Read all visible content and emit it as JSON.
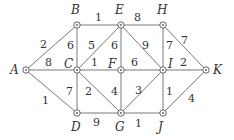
{
  "graph": {
    "nodes": [
      {
        "id": "A",
        "x": 26,
        "y": 70,
        "lx": 10,
        "ly": 74
      },
      {
        "id": "B",
        "x": 77,
        "y": 25,
        "lx": 71,
        "ly": 14
      },
      {
        "id": "E",
        "x": 121,
        "y": 25,
        "lx": 115,
        "ly": 14
      },
      {
        "id": "H",
        "x": 163,
        "y": 25,
        "lx": 157,
        "ly": 14
      },
      {
        "id": "C",
        "x": 77,
        "y": 70,
        "lx": 64,
        "ly": 68
      },
      {
        "id": "F",
        "x": 121,
        "y": 70,
        "lx": 108,
        "ly": 68
      },
      {
        "id": "I",
        "x": 163,
        "y": 70,
        "lx": 168,
        "ly": 68
      },
      {
        "id": "K",
        "x": 206,
        "y": 70,
        "lx": 213,
        "ly": 74
      },
      {
        "id": "D",
        "x": 77,
        "y": 113,
        "lx": 71,
        "ly": 131
      },
      {
        "id": "G",
        "x": 121,
        "y": 113,
        "lx": 115,
        "ly": 131
      },
      {
        "id": "J",
        "x": 163,
        "y": 113,
        "lx": 158,
        "ly": 131
      }
    ],
    "edges": [
      {
        "from": "A",
        "to": "B",
        "w": "2",
        "lx": 40,
        "ly": 48
      },
      {
        "from": "A",
        "to": "C",
        "w": "8",
        "lx": 45,
        "ly": 66
      },
      {
        "from": "A",
        "to": "D",
        "w": "1",
        "lx": 42,
        "ly": 104
      },
      {
        "from": "B",
        "to": "C",
        "w": "6",
        "lx": 67,
        "ly": 49
      },
      {
        "from": "B",
        "to": "E",
        "w": "1",
        "lx": 95,
        "ly": 21
      },
      {
        "from": "C",
        "to": "E",
        "w": "5",
        "lx": 88,
        "ly": 49
      },
      {
        "from": "E",
        "to": "F",
        "w": "6",
        "lx": 111,
        "ly": 49
      },
      {
        "from": "C",
        "to": "F",
        "w": "1",
        "lx": 91,
        "ly": 66
      },
      {
        "from": "E",
        "to": "H",
        "w": "8",
        "lx": 134,
        "ly": 21
      },
      {
        "from": "E",
        "to": "I",
        "w": "9",
        "lx": 142,
        "ly": 49
      },
      {
        "from": "F",
        "to": "I",
        "w": "6",
        "lx": 131,
        "ly": 66
      },
      {
        "from": "H",
        "to": "I",
        "w": "7",
        "lx": 166,
        "ly": 49
      },
      {
        "from": "H",
        "to": "K",
        "w": "7",
        "lx": 181,
        "ly": 44
      },
      {
        "from": "I",
        "to": "K",
        "w": "2",
        "lx": 180,
        "ly": 66
      },
      {
        "from": "C",
        "to": "D",
        "w": "7",
        "lx": 66,
        "ly": 95
      },
      {
        "from": "C",
        "to": "G",
        "w": "2",
        "lx": 85,
        "ly": 95
      },
      {
        "from": "F",
        "to": "G",
        "w": "4",
        "lx": 111,
        "ly": 95
      },
      {
        "from": "G",
        "to": "I",
        "w": "3",
        "lx": 135,
        "ly": 94
      },
      {
        "from": "I",
        "to": "J",
        "w": "1",
        "lx": 166,
        "ly": 95
      },
      {
        "from": "J",
        "to": "K",
        "w": "4",
        "lx": 188,
        "ly": 102
      },
      {
        "from": "D",
        "to": "G",
        "w": "9",
        "lx": 93,
        "ly": 126
      },
      {
        "from": "G",
        "to": "J",
        "w": "1",
        "lx": 135,
        "ly": 127
      }
    ]
  }
}
